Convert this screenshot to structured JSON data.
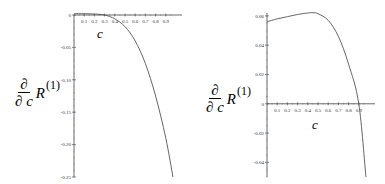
{
  "chart_data": [
    {
      "type": "line",
      "title": "",
      "xlabel": "c",
      "ylabel_parts": {
        "numerator": "∂",
        "denominator": "∂ c",
        "function": "R",
        "superscript": "(1)"
      },
      "xlim": [
        0,
        1.0
      ],
      "ylim": [
        -0.25,
        0.0
      ],
      "xticks": [
        "0.1",
        "0.2",
        "0.3",
        "0.4",
        "0.5",
        "0.6",
        "0.7",
        "0.8",
        "0.9"
      ],
      "yticks": [
        "0",
        "-0.05",
        "-0.10",
        "-0.15",
        "-0.20",
        "-0.25"
      ],
      "grid": false,
      "series": [
        {
          "name": "dR1/dc",
          "color": "#555555",
          "x": [
            0.0,
            0.1,
            0.2,
            0.3,
            0.4,
            0.5,
            0.6,
            0.7,
            0.8,
            0.9,
            0.97
          ],
          "y": [
            0.002,
            0.002,
            0.0015,
            0.0,
            -0.006,
            -0.018,
            -0.04,
            -0.075,
            -0.125,
            -0.19,
            -0.25
          ]
        }
      ]
    },
    {
      "type": "line",
      "title": "",
      "xlabel": "c",
      "ylabel_parts": {
        "numerator": "∂",
        "denominator": "∂ c",
        "function": "R",
        "superscript": "(1)"
      },
      "xlim": [
        0,
        1.0
      ],
      "ylim": [
        -0.05,
        0.062
      ],
      "xticks": [
        "0.1",
        "0.2",
        "0.3",
        "0.4",
        "0.5",
        "0.6",
        "0.7",
        "0.8",
        "0.9"
      ],
      "yticks": [
        "0.06",
        "0.04",
        "0.02",
        "0",
        "-0.02",
        "-0.04"
      ],
      "grid": false,
      "series": [
        {
          "name": "dR1/dc",
          "color": "#555555",
          "x": [
            0.0,
            0.1,
            0.2,
            0.3,
            0.4,
            0.45,
            0.5,
            0.6,
            0.7,
            0.8,
            0.9,
            0.97
          ],
          "y": [
            0.056,
            0.058,
            0.0595,
            0.061,
            0.062,
            0.0622,
            0.0615,
            0.057,
            0.046,
            0.027,
            0.0,
            -0.05
          ]
        }
      ]
    }
  ],
  "plots": [
    {
      "ylabel": {
        "num": "∂",
        "den_sym": "∂",
        "den_var": "c",
        "fn": "R",
        "sup": "(1)"
      },
      "xname": "c"
    },
    {
      "ylabel": {
        "num": "∂",
        "den_sym": "∂",
        "den_var": "c",
        "fn": "R",
        "sup": "(1)"
      },
      "xname": "c"
    }
  ]
}
